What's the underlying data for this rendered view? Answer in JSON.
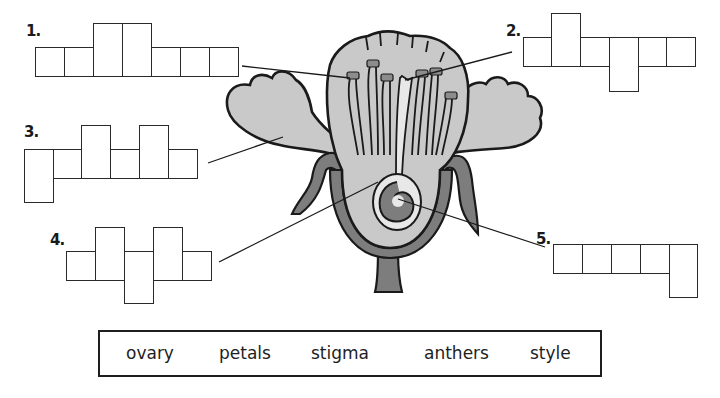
{
  "colors": {
    "outline": "#1a1a1a",
    "petal_fill": "#c9c9c9",
    "sepal_stem_fill": "#7d7d7d",
    "stigma_fill": "#e8e8e8",
    "anther_fill": "#8c8c8c",
    "background": "#ffffff"
  },
  "puzzles": [
    {
      "number": "1.",
      "answer_length": 7,
      "points_to": "anthers"
    },
    {
      "number": "2.",
      "answer_length": 6,
      "points_to": "stigma"
    },
    {
      "number": "3.",
      "answer_length": 6,
      "points_to": "petals"
    },
    {
      "number": "4.",
      "answer_length": 5,
      "points_to": "style"
    },
    {
      "number": "5.",
      "answer_length": 5,
      "points_to": "ovary"
    }
  ],
  "word_bank": {
    "words": [
      "ovary",
      "petals",
      "stigma",
      "anthers",
      "style"
    ]
  }
}
